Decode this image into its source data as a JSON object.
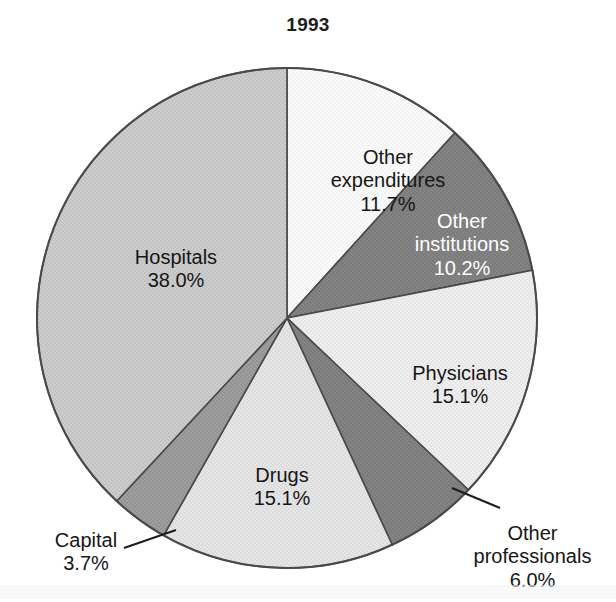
{
  "chart_data": {
    "type": "pie",
    "title": "1993",
    "xlabel": "",
    "ylabel": "",
    "legend": "none",
    "grid": false,
    "units": "percent",
    "start_angle_deg": 0,
    "direction": "clockwise",
    "categories": [
      "Other expenditures",
      "Other institutions",
      "Physicians",
      "Other professionals",
      "Drugs",
      "Capital",
      "Hospitals"
    ],
    "values": [
      11.7,
      10.2,
      15.1,
      6.0,
      15.1,
      3.7,
      38.0
    ],
    "value_labels": [
      "11.7%",
      "10.2%",
      "15.1%",
      "6.0%",
      "15.1%",
      "3.7%",
      "38.0%"
    ],
    "slices": [
      {
        "name": "Other expenditures",
        "value": 11.7,
        "value_label": "11.7%",
        "color": "#f7f7f7",
        "label_color": "#161616",
        "inside": true,
        "leader_line": false,
        "label_x": 308,
        "label_y": 122,
        "label_width": 160
      },
      {
        "name": "Other institutions",
        "value": 10.2,
        "value_label": "10.2%",
        "color": "#808080",
        "label_color": "#ffffff",
        "inside": true,
        "leader_line": false,
        "label_x": 392,
        "label_y": 186,
        "label_width": 140
      },
      {
        "name": "Physicians",
        "value": 15.1,
        "value_label": "15.1%",
        "color": "#ebebeb",
        "label_color": "#161616",
        "inside": true,
        "leader_line": false,
        "label_x": 385,
        "label_y": 338,
        "label_width": 150
      },
      {
        "name": "Other professionals",
        "value": 6.0,
        "value_label": "6.0%",
        "color": "#808080",
        "label_color": "#161616",
        "inside": false,
        "leader_line": true,
        "label_x": 455,
        "label_y": 498,
        "label_width": 155
      },
      {
        "name": "Drugs",
        "value": 15.1,
        "value_label": "15.1%",
        "color": "#e2e2e2",
        "label_color": "#161616",
        "inside": true,
        "leader_line": false,
        "label_x": 212,
        "label_y": 440,
        "label_width": 140
      },
      {
        "name": "Capital",
        "value": 3.7,
        "value_label": "3.7%",
        "color": "#9a9a9a",
        "label_color": "#161616",
        "inside": false,
        "leader_line": true,
        "label_x": 16,
        "label_y": 505,
        "label_width": 140
      },
      {
        "name": "Hospitals",
        "value": 38.0,
        "value_label": "38.0%",
        "color": "#c8c8c8",
        "label_color": "#161616",
        "inside": true,
        "leader_line": false,
        "label_x": 96,
        "label_y": 222,
        "label_width": 160
      }
    ],
    "geometry": {
      "center_x": 287,
      "center_y": 318,
      "radius": 250,
      "outline_color": "#4a4a4a"
    }
  }
}
